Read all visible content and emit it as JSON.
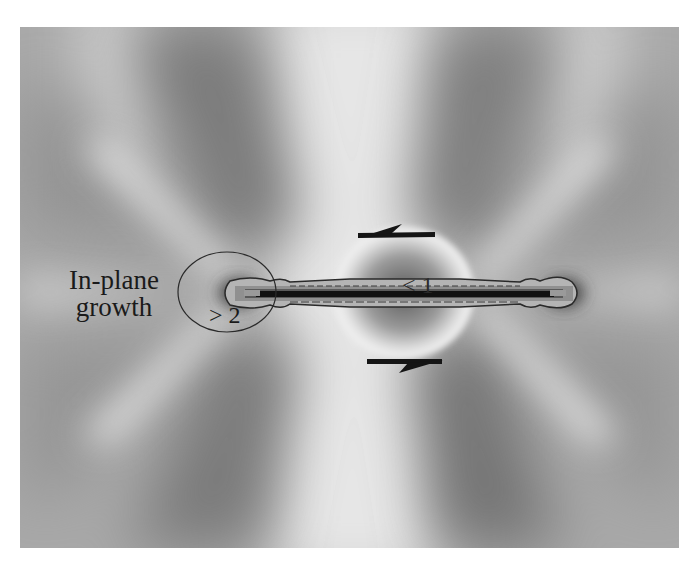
{
  "figure": {
    "colors": {
      "background_mid": "#a9a9a9",
      "light_lobe": "#f2f2f2",
      "dark_lobe": "#6e6e6e",
      "crack_core": "#111111",
      "annotation": "#1a1a1a"
    },
    "labels": {
      "in_plane_line1": "In-plane",
      "in_plane_line2": "growth",
      "greater_than": "> 2",
      "less_than": "< 1"
    },
    "arrows": [
      {
        "name": "top-shear-arrow",
        "direction": "left"
      },
      {
        "name": "bottom-shear-arrow",
        "direction": "right"
      }
    ]
  }
}
